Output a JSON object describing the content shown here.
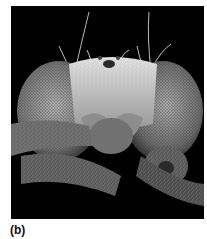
{
  "figure": {
    "label": "(b)",
    "image_alt": "Scanning electron micrograph of a fly head, frontal view",
    "background_color": "#000000"
  }
}
